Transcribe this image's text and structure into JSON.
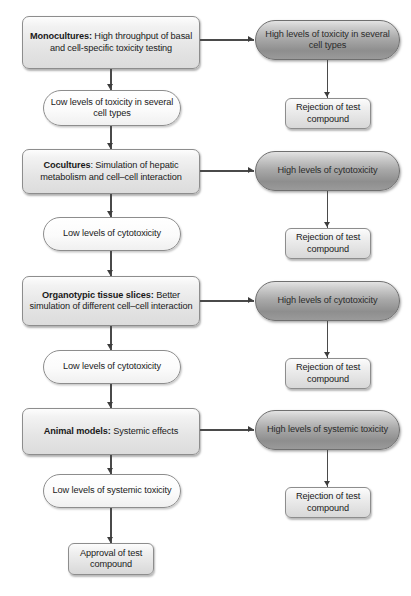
{
  "diagram": {
    "colors": {
      "method_box_fill": "#e4e4e4",
      "high_toxicity_fill": "#a9a9a9",
      "low_toxicity_fill": "#fbfbfb",
      "outcome_fill": "#e0e0e0",
      "border": "#8d8d8d",
      "connector": "#4a4a4a",
      "text": "#1a1a1a"
    },
    "stages": [
      {
        "id": "monocultures",
        "method_label_bold": "Monocultures:",
        "method_label_rest": " High throughput of basal and cell-specific toxicity testing",
        "high_outcome": "High levels of toxicity in several cell types",
        "rejection": "Rejection of test compound",
        "low_outcome": "Low levels of toxicity in several cell types"
      },
      {
        "id": "cocultures",
        "method_label_bold": "Cocultures",
        "method_label_rest": ": Simulation of hepatic metabolism and cell–cell interaction",
        "high_outcome": "High levels of cytotoxicity",
        "rejection": "Rejection of test compound",
        "low_outcome": "Low levels of cytotoxicity"
      },
      {
        "id": "organotypic-tissue-slices",
        "method_label_bold": "Organotypic tissue slices:",
        "method_label_rest": " Better simulation of different cell–cell interaction",
        "high_outcome": "High levels of cytotoxicity",
        "rejection": "Rejection of test compound",
        "low_outcome": "Low levels of cytotoxicity"
      },
      {
        "id": "animal-models",
        "method_label_bold": "Animal models:",
        "method_label_rest": " Systemic effects",
        "high_outcome": "High levels of systemic toxicity",
        "rejection": "Rejection of test compound",
        "low_outcome": "Low levels of systemic toxicity"
      }
    ],
    "final_outcome": "Approval of test compound"
  }
}
